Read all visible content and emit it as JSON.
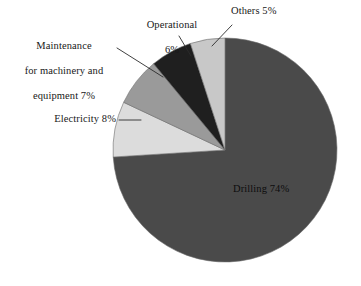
{
  "chart_data": {
    "type": "pie",
    "title": "",
    "subtitle": "",
    "xlabel": "",
    "ylabel": "",
    "legend_position": "none",
    "grid": false,
    "labels_inside": [
      "Drilling 74%"
    ],
    "categories": [
      "Drilling",
      "Others",
      "Operational",
      "Maintenance for machinery and equipment",
      "Electricity"
    ],
    "values": [
      74,
      5,
      6,
      7,
      8
    ],
    "units": "%",
    "slices": [
      {
        "name": "Drilling",
        "value": 74,
        "label": "Drilling 74%",
        "color": "#4a4a4a",
        "label_placement": "inside"
      },
      {
        "name": "Others",
        "value": 5,
        "label": "Others 5%",
        "color": "#c8c8c8",
        "label_placement": "callout"
      },
      {
        "name": "Operational",
        "value": 6,
        "label": "Operational\n6%",
        "color": "#1f1f1f",
        "label_placement": "callout"
      },
      {
        "name": "Maintenance for machinery and equipment",
        "value": 7,
        "label": "Maintenance\nfor machinery and\nequipment 7%",
        "color": "#9a9a9a",
        "label_placement": "callout"
      },
      {
        "name": "Electricity",
        "value": 8,
        "label": "Electricity 8%",
        "color": "#dcdcdc",
        "label_placement": "callout"
      }
    ]
  },
  "labels": {
    "drilling": "Drilling 74%",
    "others": "Others 5%",
    "operational_line1": "Operational",
    "operational_line2": "6%",
    "maintenance_line1": "Maintenance",
    "maintenance_line2": "for machinery and",
    "maintenance_line3": "equipment 7%",
    "electricity": "Electricity 8%"
  },
  "colors": {
    "background": "#ffffff",
    "drilling": "#4a4a4a",
    "others": "#c8c8c8",
    "operational": "#1f1f1f",
    "maintenance": "#9a9a9a",
    "electricity": "#dcdcdc",
    "leader_line": "#2b2b2b",
    "slice_outline": "#6b6b6b",
    "text": "#181818"
  }
}
